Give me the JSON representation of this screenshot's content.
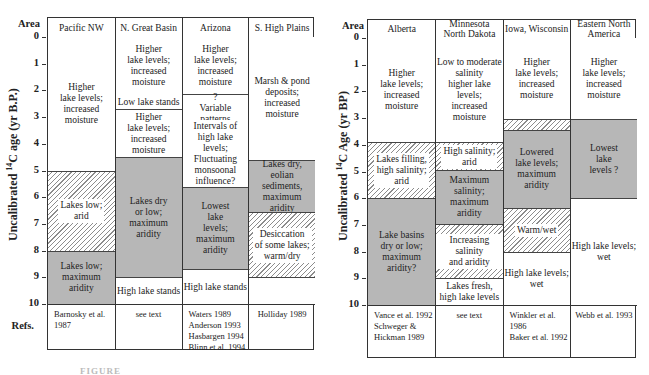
{
  "figure": {
    "caption_fragment": "FIGURE",
    "hatch_color": "#8c8c8c",
    "gray_fill": "#b7b7b7",
    "legend_note": "white = higher lake levels/moist; gray = low/dry, maximum aridity; hatched = transitional/intermediate"
  },
  "left_panel": {
    "area_label": "Area",
    "refs_label": "Refs.",
    "y_axis_title_pre": "Uncalibrated ",
    "y_axis_title_sup": "14",
    "y_axis_title_post": "C age (yr B.P.)",
    "y_ticks": [
      "0",
      "1",
      "2",
      "3",
      "4",
      "5",
      "6",
      "7",
      "8",
      "9",
      "10"
    ],
    "columns": [
      {
        "name": "Pacific NW",
        "blocks": [
          {
            "from": 0,
            "to": 5,
            "fill": "white",
            "text": "Higher\nlake levels;\nincreased\nmoisture"
          },
          {
            "from": 5,
            "to": 8,
            "fill": "hatch",
            "text": "Lakes low;\narid"
          },
          {
            "from": 8,
            "to": 10,
            "fill": "gray",
            "text": "Lakes low;\nmaximum\naridity"
          }
        ],
        "refs": "Barnosky et al.\n   1987"
      },
      {
        "name": "N. Great Basin",
        "blocks": [
          {
            "from": 0,
            "to": 2.2,
            "fill": "white",
            "text": "Higher\nlake levels;\nincreased\nmoisture"
          },
          {
            "from": 2.2,
            "to": 2.7,
            "fill": "hatch",
            "text": "Low lake stands"
          },
          {
            "from": 2.7,
            "to": 4.5,
            "fill": "white",
            "text": "Higher\nlake levels;\nincreased\nmoisture"
          },
          {
            "from": 4.5,
            "to": 9.0,
            "fill": "gray",
            "text": "Lakes dry\nor low;\nmaximum\naridity"
          },
          {
            "from": 9.0,
            "to": 10,
            "fill": "white",
            "text": "High lake stands"
          }
        ],
        "refs": "see text"
      },
      {
        "name": "Arizona",
        "blocks": [
          {
            "from": 0,
            "to": 2.15,
            "fill": "white",
            "text": "Higher\nlake levels;\nincreased\nmoisture"
          },
          {
            "from": 2.15,
            "to": 3.15,
            "fill": "white",
            "text": "?\nVariable\npatterns"
          },
          {
            "from": 3.15,
            "to": 5.6,
            "fill": "hatch",
            "text": "Intervals of\nhigh lake levels;\nFluctuating\nmonsoonal\ninfluence?"
          },
          {
            "from": 5.6,
            "to": 8.7,
            "fill": "gray",
            "text": "Lowest\nlake\nlevels;\nmaximum\naridity"
          },
          {
            "from": 8.7,
            "to": 10,
            "fill": "white",
            "text": "High  lake stands"
          }
        ],
        "refs": "Waters 1989\nAnderson 1993\nHasbargen 1994\nBlinn et al. 1994"
      },
      {
        "name": "S. High Plains",
        "blocks": [
          {
            "from": 0,
            "to": 4.6,
            "fill": "white",
            "text": "Marsh & pond\ndeposits;\nincreased\nmoisture"
          },
          {
            "from": 4.6,
            "to": 6.55,
            "fill": "gray",
            "text": "Lakes dry,\neolian sediments,\nmaximum\naridity"
          },
          {
            "from": 6.55,
            "to": 9.0,
            "fill": "hatch",
            "text": "Desiccation\nof some lakes;\nwarm/dry"
          },
          {
            "from": 9.0,
            "to": 10,
            "fill": "white",
            "text": ""
          }
        ],
        "refs": "Holliday 1989"
      }
    ]
  },
  "right_panel": {
    "area_label": "Area",
    "refs_label": "Refs.",
    "y_axis_title_pre": "Uncalibrated ",
    "y_axis_title_sup": "14",
    "y_axis_title_post": "C Age (yr BP)",
    "y_ticks": [
      "0",
      "1",
      "2",
      "3",
      "4",
      "5",
      "6",
      "7",
      "8",
      "9",
      "10"
    ],
    "columns": [
      {
        "name": "Alberta",
        "blocks": [
          {
            "from": 0,
            "to": 3.9,
            "fill": "white",
            "text": "Higher\nlake levels;\nincreased\nmoisture"
          },
          {
            "from": 3.9,
            "to": 6.0,
            "fill": "hatch",
            "text": "Lakes filling,\nhigh salinity;\narid"
          },
          {
            "from": 6.0,
            "to": 10,
            "fill": "gray",
            "text": "Lake basins\ndry or low;\nmaximum\naridity?"
          }
        ],
        "refs": "Vance et al. 1992\nSchweger &\n    Hickman 1989"
      },
      {
        "name": "Minnesota\nNorth Dakota",
        "blocks": [
          {
            "from": 0,
            "to": 3.9,
            "fill": "white",
            "text": "Low to moderate\nsalinity\nhigher lake levels;\nincreased\nmoisture"
          },
          {
            "from": 3.9,
            "to": 4.95,
            "fill": "hatch",
            "text": "High salinity;\narid"
          },
          {
            "from": 4.95,
            "to": 6.95,
            "fill": "gray",
            "text": "Maximum\nsalinity;\nmaximum\naridity"
          },
          {
            "from": 6.95,
            "to": 9.0,
            "fill": "hatch",
            "text": "Increasing salinity\nand aridity"
          },
          {
            "from": 9.0,
            "to": 10,
            "fill": "white",
            "text": "Lakes fresh,\nhigh lake levels"
          }
        ],
        "refs": "see text"
      },
      {
        "name": "Iowa, Wisconsin",
        "blocks": [
          {
            "from": 0,
            "to": 3.05,
            "fill": "white",
            "text": "Higher\nlake levels;\nincreased\nmoisture"
          },
          {
            "from": 3.05,
            "to": 3.45,
            "fill": "hatch",
            "text": ""
          },
          {
            "from": 3.45,
            "to": 6.35,
            "fill": "gray",
            "text": "Lowered\nlake levels;\nmaximum\naridity"
          },
          {
            "from": 6.35,
            "to": 8.0,
            "fill": "hatch",
            "text": "Warm/wet"
          },
          {
            "from": 8.0,
            "to": 10,
            "fill": "white",
            "text": "High  lake levels;\nwet"
          }
        ],
        "refs": "Winkler et al. 1986\nBaker et al. 1992"
      },
      {
        "name": "Eastern North\nAmerica",
        "blocks": [
          {
            "from": 0,
            "to": 3.05,
            "fill": "white",
            "text": "Higher\nlake levels;\nincreased\nmoisture"
          },
          {
            "from": 3.05,
            "to": 6.0,
            "fill": "gray",
            "text": "Lowest\nlake\nlevels ?"
          },
          {
            "from": 6.0,
            "to": 10,
            "fill": "white",
            "text": "High  lake levels;\nwet"
          }
        ],
        "refs": "Webb et al. 1993"
      }
    ]
  }
}
